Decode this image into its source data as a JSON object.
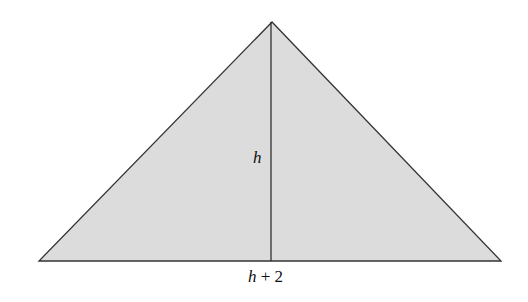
{
  "figure": {
    "type": "triangle",
    "fill_color": "#dcdcdc",
    "stroke_color": "#333333",
    "vertices": {
      "apex": [
        272,
        22
      ],
      "bottom_left": [
        39,
        261
      ],
      "bottom_right": [
        501,
        261
      ]
    },
    "altitude": {
      "from": [
        271,
        22
      ],
      "to": [
        271,
        261
      ]
    }
  },
  "labels": {
    "height": {
      "variable": "h"
    },
    "base": {
      "variable": "h",
      "rest": " + 2"
    }
  }
}
